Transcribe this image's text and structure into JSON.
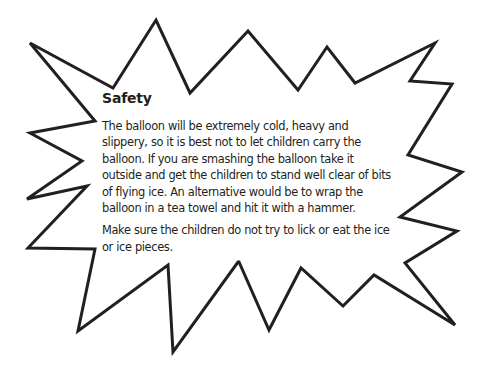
{
  "callout": {
    "shape": "starburst",
    "stroke_color": "#231f20",
    "fill_color": "#ffffff",
    "title": "Safety",
    "paragraphs": [
      "The balloon will be extremely cold, heavy and slippery, so it is best not to let children carry the balloon. If you are smashing the balloon take it outside and get the children to stand well clear of bits of flying ice. An alternative would be to wrap the balloon in a tea towel and hit it with a hammer.",
      "Make sure the children do not try to lick or eat the ice or ice pieces."
    ]
  }
}
